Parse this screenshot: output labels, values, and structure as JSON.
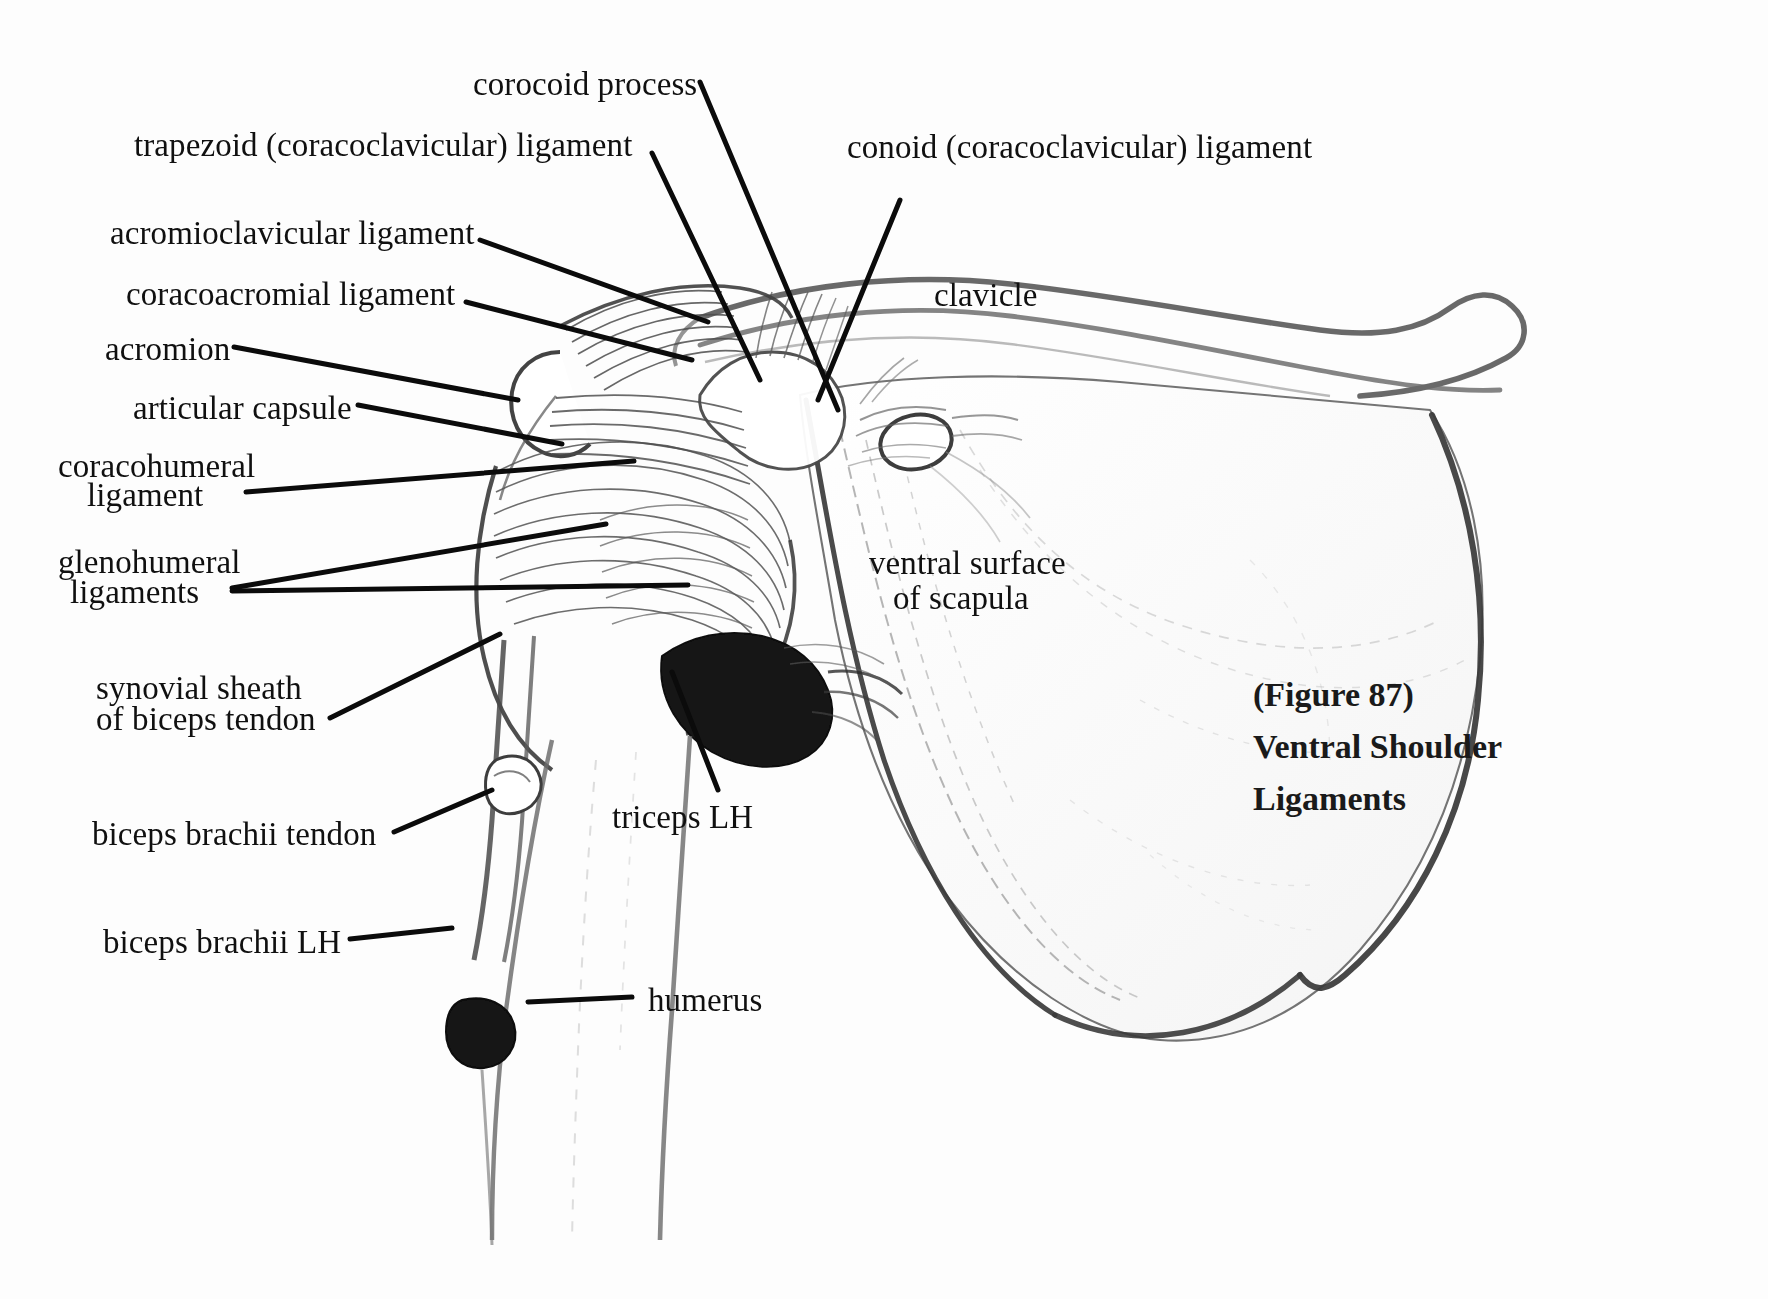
{
  "figure": {
    "caption_lines": [
      "(Figure 87)",
      "Ventral Shoulder",
      "Ligaments"
    ],
    "caption_number": "(Figure 87)",
    "background_color": "#fdfdfd",
    "ink_color": "#101010",
    "medium": "pencil-drawing"
  },
  "labels": {
    "corocoid_process": "corocoid process",
    "trapezoid_ligament": "trapezoid (coracoclavicular) ligament",
    "conoid_ligament": "conoid (coracoclavicular) ligament",
    "acromioclavicular_ligament": "acromioclavicular ligament",
    "coracoacromial_ligament": "coracoacromial ligament",
    "acromion": "acromion",
    "articular_capsule": "articular capsule",
    "coracohumeral_ligament_line1": "coracohumeral",
    "coracohumeral_ligament_line2": "ligament",
    "glenohumeral_ligaments_line1": "glenohumeral",
    "glenohumeral_ligaments_line2": "ligaments",
    "synovial_sheath_line1": "synovial sheath",
    "synovial_sheath_line2": "of biceps tendon",
    "biceps_brachii_tendon": "biceps brachii tendon",
    "biceps_brachii_lh": "biceps brachii LH",
    "humerus": "humerus",
    "triceps_lh": "triceps LH",
    "clavicle": "clavicle",
    "ventral_surface_line1": "ventral surface",
    "ventral_surface_line2": "of scapula"
  }
}
